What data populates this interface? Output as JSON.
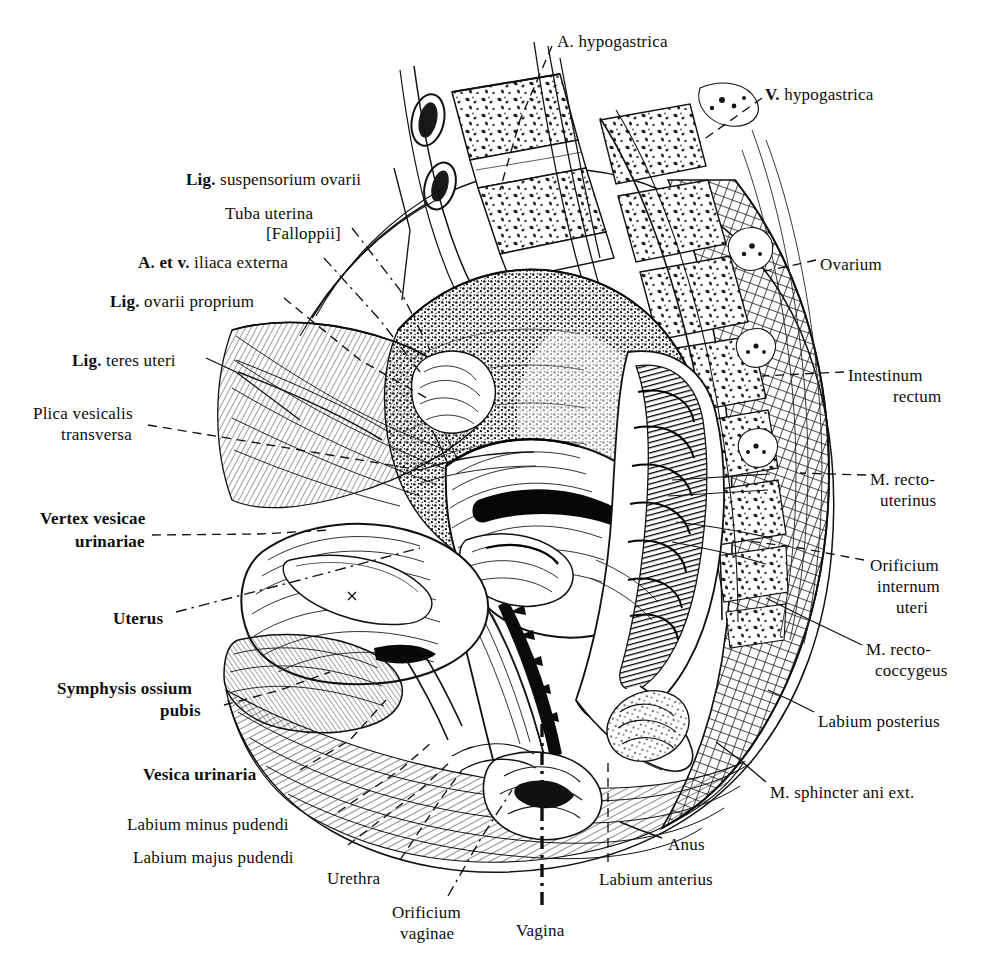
{
  "figure": {
    "style": "pen-and-ink anatomical engraving",
    "background_color": "#ffffff",
    "ink_color": "#111111"
  },
  "labels": [
    {
      "id": "a-hypogastrica",
      "text": "A. hypogastrica",
      "bold_prefix": "",
      "x": 557,
      "y": 32,
      "align": "left"
    },
    {
      "id": "v-hypogastrica",
      "text": "V. hypogastrica",
      "bold_prefix": "V.",
      "x": 765,
      "y": 85,
      "align": "left"
    },
    {
      "id": "lig-susp-ovarii",
      "text": "Lig. suspensorium ovarii",
      "bold_prefix": "Lig.",
      "x": 186,
      "y": 170,
      "align": "left"
    },
    {
      "id": "tuba-uterina",
      "text": "Tuba uterina",
      "bold_prefix": "",
      "x": 225,
      "y": 204,
      "align": "left"
    },
    {
      "id": "falloppii",
      "text": "[Falloppii]",
      "bold_prefix": "",
      "x": 266,
      "y": 224,
      "align": "left"
    },
    {
      "id": "a-et-v-iliaca",
      "text": "A. et v. iliaca externa",
      "bold_prefix": "A. et v.",
      "x": 138,
      "y": 253,
      "align": "left"
    },
    {
      "id": "lig-ovarii-proprium",
      "text": "Lig. ovarii proprium",
      "bold_prefix": "Lig.",
      "x": 110,
      "y": 292,
      "align": "left"
    },
    {
      "id": "lig-teres-uteri",
      "text": "Lig. teres uteri",
      "bold_prefix": "Lig.",
      "x": 72,
      "y": 351,
      "align": "left"
    },
    {
      "id": "plica-vesicalis",
      "text": "Plica vesicalis",
      "bold_prefix": "",
      "x": 33,
      "y": 404,
      "align": "left"
    },
    {
      "id": "plica-transversa",
      "text": "transversa",
      "bold_prefix": "",
      "x": 61,
      "y": 425,
      "align": "left"
    },
    {
      "id": "vertex-vesicae",
      "text": "Vertex vesicae",
      "bold_prefix": "ALL",
      "x": 40,
      "y": 509,
      "align": "left"
    },
    {
      "id": "vesicae-urinariae",
      "text": "urinariae",
      "bold_prefix": "ALL",
      "x": 75,
      "y": 532,
      "align": "left"
    },
    {
      "id": "uterus",
      "text": "Uterus",
      "bold_prefix": "ALL",
      "x": 113,
      "y": 609,
      "align": "left"
    },
    {
      "id": "symphysis-ossium",
      "text": "Symphysis ossium",
      "bold_prefix": "ALL",
      "x": 57,
      "y": 679,
      "align": "left"
    },
    {
      "id": "symphysis-pubis",
      "text": "pubis",
      "bold_prefix": "ALL",
      "x": 160,
      "y": 701,
      "align": "left"
    },
    {
      "id": "vesica-urinaria",
      "text": "Vesica urinaria",
      "bold_prefix": "ALL",
      "x": 143,
      "y": 765,
      "align": "left"
    },
    {
      "id": "labium-minus",
      "text": "Labium minus pudendi",
      "bold_prefix": "",
      "x": 127,
      "y": 815,
      "align": "left"
    },
    {
      "id": "labium-majus",
      "text": "Labium majus pudendi",
      "bold_prefix": "",
      "x": 133,
      "y": 848,
      "align": "left"
    },
    {
      "id": "urethra",
      "text": "Urethra",
      "bold_prefix": "",
      "x": 327,
      "y": 869,
      "align": "left"
    },
    {
      "id": "orificium-vaginae1",
      "text": "Orificium",
      "bold_prefix": "",
      "x": 392,
      "y": 903,
      "align": "left"
    },
    {
      "id": "orificium-vaginae2",
      "text": "vaginae",
      "bold_prefix": "",
      "x": 400,
      "y": 924,
      "align": "left"
    },
    {
      "id": "vagina",
      "text": "Vagina",
      "bold_prefix": "",
      "x": 516,
      "y": 921,
      "align": "left"
    },
    {
      "id": "labium-anterius",
      "text": "Labium anterius",
      "bold_prefix": "",
      "x": 599,
      "y": 870,
      "align": "left"
    },
    {
      "id": "anus",
      "text": "Anus",
      "bold_prefix": "",
      "x": 668,
      "y": 835,
      "align": "left"
    },
    {
      "id": "m-sphincter-ani",
      "text": "M. sphincter ani ext.",
      "bold_prefix": "",
      "x": 770,
      "y": 783,
      "align": "left"
    },
    {
      "id": "labium-posterius",
      "text": "Labium posterius",
      "bold_prefix": "",
      "x": 818,
      "y": 712,
      "align": "left"
    },
    {
      "id": "m-recto-coccygeus1",
      "text": "M. recto-",
      "bold_prefix": "",
      "x": 866,
      "y": 640,
      "align": "left"
    },
    {
      "id": "m-recto-coccygeus2",
      "text": "coccygeus",
      "bold_prefix": "",
      "x": 875,
      "y": 661,
      "align": "left"
    },
    {
      "id": "orificium-internum1",
      "text": "Orificium",
      "bold_prefix": "",
      "x": 870,
      "y": 556,
      "align": "left"
    },
    {
      "id": "orificium-internum2",
      "text": "internum",
      "bold_prefix": "",
      "x": 877,
      "y": 577,
      "align": "left"
    },
    {
      "id": "orificium-internum3",
      "text": "uteri",
      "bold_prefix": "",
      "x": 896,
      "y": 598,
      "align": "left"
    },
    {
      "id": "m-recto-uterinus1",
      "text": "M. recto-",
      "bold_prefix": "",
      "x": 870,
      "y": 470,
      "align": "left"
    },
    {
      "id": "m-recto-uterinus2",
      "text": "uterinus",
      "bold_prefix": "",
      "x": 880,
      "y": 491,
      "align": "left"
    },
    {
      "id": "intestinum-rectum1",
      "text": "Intestinum",
      "bold_prefix": "",
      "x": 848,
      "y": 366,
      "align": "left"
    },
    {
      "id": "intestinum-rectum2",
      "text": "rectum",
      "bold_prefix": "",
      "x": 893,
      "y": 387,
      "align": "left"
    },
    {
      "id": "ovarium",
      "text": "Ovarium",
      "bold_prefix": "",
      "x": 820,
      "y": 255,
      "align": "left"
    }
  ],
  "leader_lines": [
    {
      "id": "leader-a-hypogastrica",
      "style": "dashed",
      "points": "552,46 520,120 500,190"
    },
    {
      "id": "leader-v-hypogastrica",
      "style": "dashed",
      "points": "762,98 720,128 700,142"
    },
    {
      "id": "leader-lig-susp-ovarii",
      "style": "solid",
      "points": "394,168 410,230 402,300"
    },
    {
      "id": "leader-tuba-uterina",
      "style": "dashdot",
      "points": "352,228 400,290 430,350"
    },
    {
      "id": "leader-a-et-v-iliaca",
      "style": "dashdot",
      "points": "324,258 380,320 420,372"
    },
    {
      "id": "leader-lig-ovarii-prop",
      "style": "dashed",
      "points": "284,298 360,360 430,400"
    },
    {
      "id": "leader-lig-teres-uteri",
      "style": "solid",
      "points": "206,358 236,372 300,420"
    },
    {
      "id": "leader-plica-vesicalis",
      "style": "dashed",
      "points": "148,425 300,450 420,470"
    },
    {
      "id": "leader-vertex-vesicae",
      "style": "dashed",
      "points": "152,535 260,534 330,530"
    },
    {
      "id": "leader-uterus",
      "style": "dashdot",
      "points": "176,612 300,580 420,548"
    },
    {
      "id": "leader-symphysis",
      "style": "dashed",
      "points": "224,705 280,690 330,672"
    },
    {
      "id": "leader-vesica-urinaria",
      "style": "dashed",
      "points": "300,770 350,740 386,700"
    },
    {
      "id": "leader-labium-minus",
      "style": "dashed",
      "points": "338,812 400,770 432,742"
    },
    {
      "id": "leader-labium-majus",
      "style": "dashed",
      "points": "348,845 420,790 452,760"
    },
    {
      "id": "leader-urethra",
      "style": "dashed",
      "points": "400,860 440,800 462,770"
    },
    {
      "id": "leader-orificium-vag",
      "style": "dashdot",
      "points": "448,896 480,840 512,790"
    },
    {
      "id": "leader-vagina",
      "style": "thick-dashdot",
      "points": "542,905 542,800 542,700"
    },
    {
      "id": "leader-labium-anterius",
      "style": "dashed",
      "points": "608,862 608,800 608,760"
    },
    {
      "id": "leader-anus",
      "style": "solid",
      "points": "662,838 640,830 620,822"
    },
    {
      "id": "leader-m-sphincter",
      "style": "solid",
      "points": "766,782 740,760 716,742"
    },
    {
      "id": "leader-labium-posterius",
      "style": "solid",
      "points": "814,712 790,700 768,690"
    },
    {
      "id": "leader-m-recto-coccyg",
      "style": "solid",
      "points": "862,645 810,620 766,598"
    },
    {
      "id": "leader-orificium-int",
      "style": "dashed",
      "points": "864,560 800,548 742,540"
    },
    {
      "id": "leader-m-recto-uterinus",
      "style": "dashed",
      "points": "866,475 830,474 800,473"
    },
    {
      "id": "leader-intestinum",
      "style": "dashed",
      "points": "844,372 800,374 762,376"
    },
    {
      "id": "leader-ovarium",
      "style": "dashed",
      "points": "816,260 790,266 760,272"
    }
  ]
}
